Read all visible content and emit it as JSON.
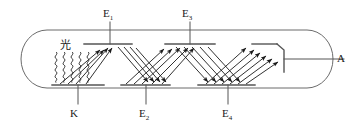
{
  "figure": {
    "stroke_color": "#4d4d4d",
    "arrow_color": "#1a1a1a",
    "background": "#ffffff",
    "width": 354,
    "height": 131
  },
  "labels": {
    "light": {
      "text": "光",
      "x": 60,
      "y": 40,
      "meaning": "light"
    },
    "cathode": {
      "text": "K",
      "x": 70,
      "y": 108
    },
    "dynode1": {
      "base": "E",
      "sub": "1",
      "x": 103,
      "y": 8
    },
    "dynode2": {
      "base": "E",
      "sub": "2",
      "x": 139,
      "y": 108
    },
    "dynode3": {
      "base": "E",
      "sub": "3",
      "x": 182,
      "y": 8
    },
    "dynode4": {
      "base": "E",
      "sub": "4",
      "x": 222,
      "y": 108
    },
    "anode": {
      "text": "A",
      "x": 337,
      "y": 58
    }
  },
  "components": {
    "envelope": {
      "name": "vacuum-tube-envelope",
      "shape": "rounded-capsule"
    },
    "photon_count": 5,
    "electrode_plates": [
      {
        "name": "cathode-plate",
        "position": "bottom-left"
      },
      {
        "name": "dynode-1-plate",
        "position": "top"
      },
      {
        "name": "dynode-2-plate",
        "position": "bottom"
      },
      {
        "name": "dynode-3-plate",
        "position": "top"
      },
      {
        "name": "dynode-4-plate",
        "position": "bottom"
      },
      {
        "name": "anode-collector",
        "position": "right"
      }
    ],
    "electron_beams": [
      {
        "from": "K",
        "to": "E1",
        "arrows": 4
      },
      {
        "from": "E1",
        "to": "E2",
        "arrows": 4
      },
      {
        "from": "E2",
        "to": "E3",
        "arrows": 5
      },
      {
        "from": "E3",
        "to": "E4",
        "arrows": 5
      },
      {
        "from": "E4",
        "to": "A",
        "arrows": 6
      }
    ]
  }
}
